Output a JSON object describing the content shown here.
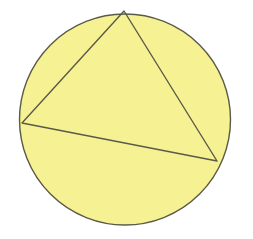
{
  "figure": {
    "type": "geometric-diagram",
    "canvas": {
      "width": 253,
      "height": 239,
      "background_color": "#FFFFFF"
    },
    "shapes": {
      "circle": {
        "name": "circle",
        "center_x": 125,
        "center_y": 119.5,
        "radius": 105.5,
        "fill_color": "#F6F294",
        "stroke_color": "#5A5A48",
        "stroke_width": 1.4
      },
      "triangle": {
        "name": "inscribed-triangle",
        "vertices": [
          {
            "label": "top",
            "x": 124,
            "y": 11
          },
          {
            "label": "left",
            "x": 22,
            "y": 123
          },
          {
            "label": "right",
            "x": 217,
            "y": 161
          }
        ],
        "fill_color": "none",
        "stroke_color": "#5A5A48",
        "stroke_width": 1.4
      }
    },
    "caption": ""
  }
}
